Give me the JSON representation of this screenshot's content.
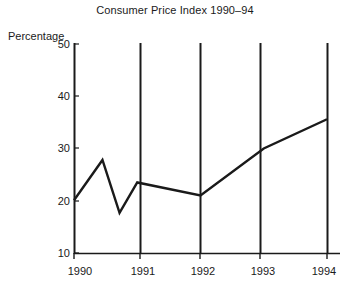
{
  "chart_data": {
    "type": "line",
    "title": "Consumer Price Index 1990–94",
    "xlabel": "",
    "ylabel": "Percentage",
    "ylim": [
      10,
      50
    ],
    "xlim": [
      1990,
      1994
    ],
    "yticks": [
      10,
      20,
      30,
      40,
      50
    ],
    "ytick_labels": [
      "10",
      "20",
      "30",
      "40",
      "50"
    ],
    "xticks": [
      1990,
      1991,
      1992,
      1993,
      1994
    ],
    "xtick_labels": [
      "1990",
      "1991",
      "1992",
      "1993",
      "1994"
    ],
    "grid": "vertical gridlines at each year tick",
    "legend": "none",
    "series": [
      {
        "name": "Consumer Price Index",
        "x": [
          1990.0,
          1990.45,
          1990.72,
          1991.0,
          1992.0,
          1993.0,
          1994.0
        ],
        "values": [
          20.1,
          27.8,
          17.7,
          23.5,
          21.0,
          30.0,
          35.6
        ]
      }
    ],
    "annotations": []
  },
  "axes": {
    "y_axis_title": "Percentage",
    "y_ticks": [
      {
        "label": "50",
        "value": 50
      },
      {
        "label": "40",
        "value": 40
      },
      {
        "label": "30",
        "value": 30
      },
      {
        "label": "20",
        "value": 20
      },
      {
        "label": "10",
        "value": 10
      }
    ],
    "x_ticks": [
      {
        "label": "1990",
        "value": 1990
      },
      {
        "label": "1991",
        "value": 1991
      },
      {
        "label": "1992",
        "value": 1992
      },
      {
        "label": "1993",
        "value": 1993
      },
      {
        "label": "1994",
        "value": 1994
      }
    ]
  },
  "colors": {
    "line": "#1a1a1a",
    "axis": "#1a1a1a",
    "gridline": "#1a1a1a",
    "background": "#ffffff",
    "text": "#1a1a1a"
  }
}
